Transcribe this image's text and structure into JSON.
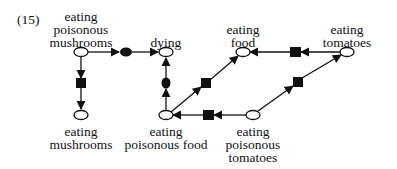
{
  "figure_number": "(15)",
  "nodes": {
    "eating_poisonous_mushrooms": {
      "lines": [
        "eating",
        "poisonous",
        "mushrooms"
      ]
    },
    "dying": {
      "lines": [
        "dying"
      ]
    },
    "eating_food": {
      "lines": [
        "eating",
        "food"
      ]
    },
    "eating_tomatoes": {
      "lines": [
        "eating",
        "tomatoes"
      ]
    },
    "eating_mushrooms": {
      "lines": [
        "eating",
        "mushrooms"
      ]
    },
    "eating_poisonous_food": {
      "lines": [
        "eating",
        "poisonous food"
      ]
    },
    "eating_poisonous_tomatoes": {
      "lines": [
        "eating",
        "poisonous",
        "tomatoes"
      ]
    }
  },
  "edges": [
    {
      "from": "eating poisonous mushrooms",
      "to": "dying",
      "link": "ellipse"
    },
    {
      "from": "eating poisonous mushrooms",
      "to": "eating mushrooms",
      "link": "square"
    },
    {
      "from": "eating poisonous food",
      "to": "dying",
      "link": "ellipse"
    },
    {
      "from": "eating poisonous food",
      "to": "eating food",
      "link": "square"
    },
    {
      "from": "eating tomatoes",
      "to": "eating food",
      "link": "square"
    },
    {
      "from": "eating poisonous tomatoes",
      "to": "eating tomatoes",
      "link": "square"
    },
    {
      "from": "eating poisonous tomatoes",
      "to": "eating poisonous food",
      "link": "square"
    }
  ],
  "colors": {
    "stroke": "#111111",
    "background": "#ffffff"
  }
}
